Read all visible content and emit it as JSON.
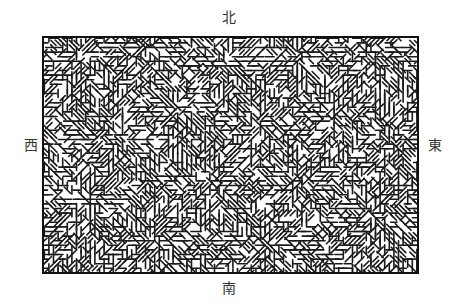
{
  "figure": {
    "type": "drainage-pattern-diagram",
    "compass": {
      "north": "北",
      "south": "南",
      "west": "西",
      "east": "東"
    },
    "frame": {
      "x": 42,
      "y": 36,
      "width": 377,
      "height": 238,
      "border_color": "#111111",
      "border_width": 2
    },
    "pattern": {
      "stroke_color": "#1a1a1a",
      "stroke_width": 1.6,
      "cell": 4.6,
      "seed": 7,
      "branch_sources": [
        {
          "x": 0.1,
          "y": 0.08
        },
        {
          "x": 0.27,
          "y": 0.05
        },
        {
          "x": 0.48,
          "y": 0.12
        },
        {
          "x": 0.68,
          "y": 0.08
        },
        {
          "x": 0.86,
          "y": 0.06
        },
        {
          "x": 0.2,
          "y": 0.42
        },
        {
          "x": 0.37,
          "y": 0.3
        },
        {
          "x": 0.58,
          "y": 0.38
        },
        {
          "x": 0.78,
          "y": 0.33
        },
        {
          "x": 0.93,
          "y": 0.45
        },
        {
          "x": 0.12,
          "y": 0.7
        },
        {
          "x": 0.45,
          "y": 0.62
        },
        {
          "x": 0.68,
          "y": 0.6
        },
        {
          "x": 0.88,
          "y": 0.75
        },
        {
          "x": 0.3,
          "y": 0.85
        },
        {
          "x": 0.6,
          "y": 0.88
        }
      ]
    }
  }
}
